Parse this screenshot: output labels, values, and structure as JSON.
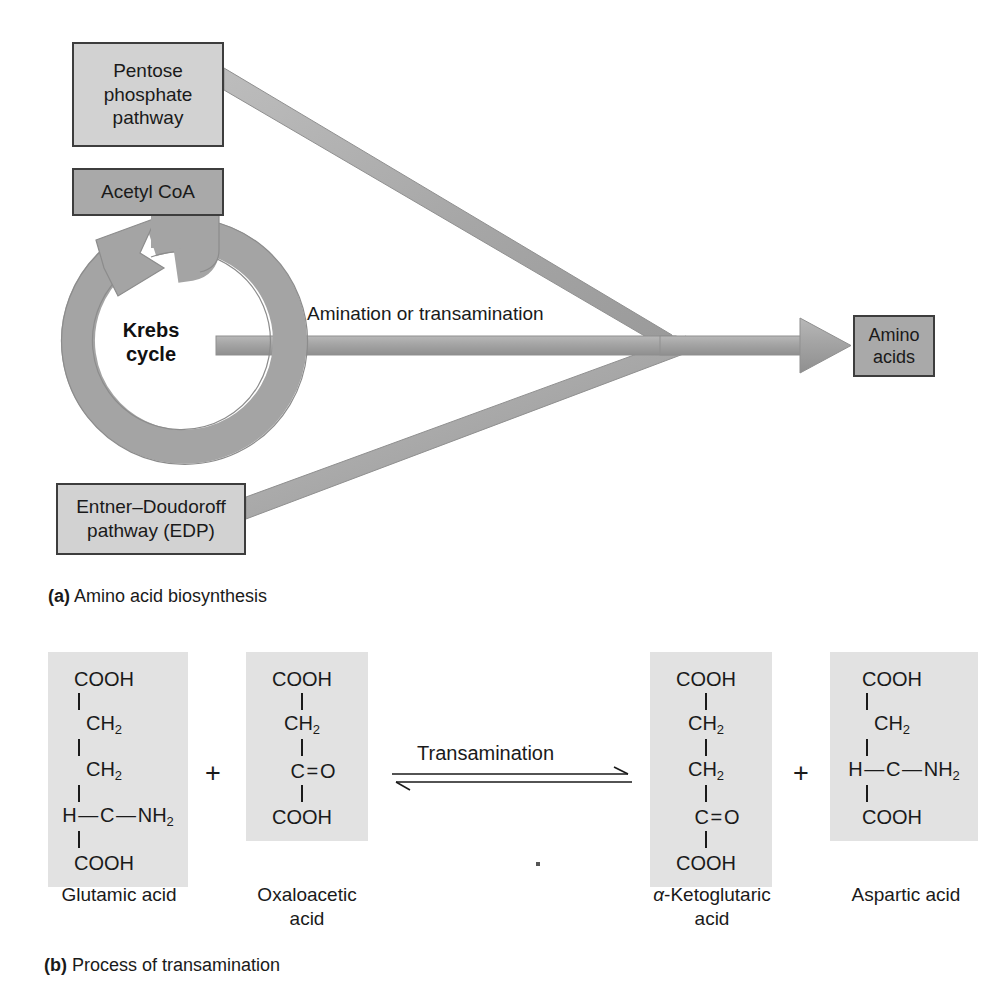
{
  "figure": {
    "panel_a": {
      "caption_label": "(a)",
      "caption_text": "Amino acid biosynthesis",
      "nodes": {
        "pentose": "Pentose\nphosphate\npathway",
        "pentose_lines": [
          "Pentose",
          "phosphate",
          "pathway"
        ],
        "acetyl_coa": "Acetyl CoA",
        "krebs_lines": [
          "Krebs",
          "cycle"
        ],
        "edp_lines": [
          "Entner–Doudoroff",
          "pathway (EDP)"
        ],
        "amino_acids_lines": [
          "Amino",
          "acids"
        ]
      },
      "flow_label": "Amination or transamination",
      "colors": {
        "box_light": "#d2d2d2",
        "box_mid": "#a9a9a9",
        "arrow_gray": "#a3a3a3",
        "arrow_edge": "#8c8c8c",
        "border": "#3d3d3d"
      }
    },
    "panel_b": {
      "caption_label": "(b)",
      "caption_text": "Process of transamination",
      "reaction_label": "Transamination",
      "plus_sign": "+",
      "molecules": [
        {
          "id": "glutamic",
          "name_lines": [
            "Glutamic acid"
          ],
          "rows": [
            "COOH",
            "CH2",
            "CH2",
            "H-C-NH2",
            "COOH"
          ]
        },
        {
          "id": "oxaloacetic",
          "name_lines": [
            "Oxaloacetic",
            "acid"
          ],
          "rows": [
            "COOH",
            "CH2",
            "C=O",
            "COOH"
          ]
        },
        {
          "id": "ketoglutaric",
          "name_lines": [
            "α-Ketoglutaric",
            "acid"
          ],
          "name_alpha": "α",
          "name_rest": "-Ketoglutaric",
          "rows": [
            "COOH",
            "CH2",
            "CH2",
            "C=O",
            "COOH"
          ]
        },
        {
          "id": "aspartic",
          "name_lines": [
            "Aspartic acid"
          ],
          "rows": [
            "COOH",
            "CH2",
            "H-C-NH2",
            "COOH"
          ]
        }
      ],
      "colors": {
        "molecule_bg": "#e2e2e2",
        "text": "#1a1a1a"
      }
    }
  }
}
